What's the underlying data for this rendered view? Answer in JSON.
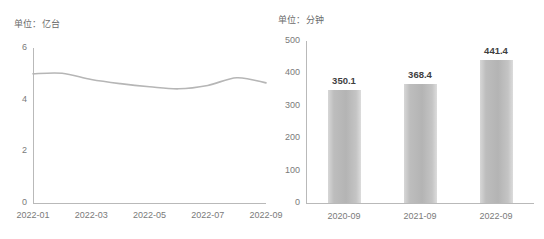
{
  "chart_data": [
    {
      "type": "line",
      "title": "单位：亿台",
      "xlabel": "",
      "ylabel": "",
      "ylim": [
        0,
        6
      ],
      "yticks": [
        0,
        2,
        4,
        6
      ],
      "ytick_labels": [
        "0",
        "2",
        "4",
        "6"
      ],
      "grid": false,
      "legend": "none",
      "line_color": "#b6b6b6",
      "x": [
        "2022-01",
        "2022-02",
        "2022-03",
        "2022-04",
        "2022-05",
        "2022-06",
        "2022-07",
        "2022-08",
        "2022-09"
      ],
      "xtick_labels": [
        "2022-01",
        "2022-03",
        "2022-05",
        "2022-07",
        "2022-09"
      ],
      "values": [
        5.0,
        5.02,
        4.78,
        4.62,
        4.5,
        4.42,
        4.55,
        4.85,
        4.65
      ]
    },
    {
      "type": "bar",
      "title": "单位：分钟",
      "xlabel": "",
      "ylabel": "",
      "ylim": [
        0,
        500
      ],
      "yticks": [
        0,
        100,
        200,
        300,
        400,
        500
      ],
      "ytick_labels": [
        "0",
        "100",
        "200",
        "300",
        "400",
        "500"
      ],
      "grid": false,
      "legend": "none",
      "bar_color": "#bcbcbc",
      "categories": [
        "2020-09",
        "2021-09",
        "2022-09"
      ],
      "values": [
        350.1,
        368.4,
        441.4
      ],
      "data_labels": [
        "350.1",
        "368.4",
        "441.4"
      ]
    }
  ]
}
